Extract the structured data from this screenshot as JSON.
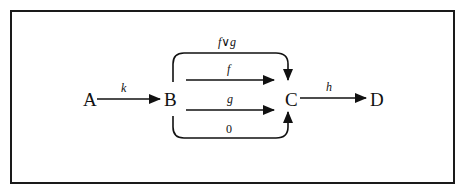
{
  "diagram": {
    "type": "commutative-diagram",
    "nodes": [
      {
        "id": "A",
        "label": "A"
      },
      {
        "id": "B",
        "label": "B"
      },
      {
        "id": "C",
        "label": "C"
      },
      {
        "id": "D",
        "label": "D"
      }
    ],
    "edges": [
      {
        "from": "A",
        "to": "B",
        "label": "k",
        "shape": "straight"
      },
      {
        "from": "B",
        "to": "C",
        "label": "f∨g",
        "shape": "curved-top"
      },
      {
        "from": "B",
        "to": "C",
        "label": "f",
        "shape": "straight-upper"
      },
      {
        "from": "B",
        "to": "C",
        "label": "g",
        "shape": "straight-lower"
      },
      {
        "from": "B",
        "to": "C",
        "label": "0",
        "shape": "curved-bottom"
      },
      {
        "from": "C",
        "to": "D",
        "label": "h",
        "shape": "straight"
      }
    ]
  },
  "colors": {
    "ink": "#111111",
    "background": "#ffffff"
  }
}
